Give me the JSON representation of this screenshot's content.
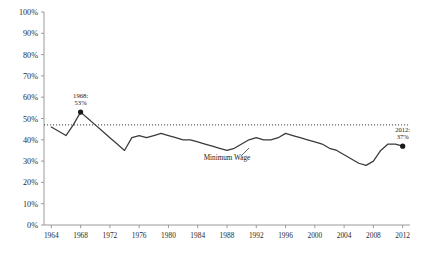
{
  "chart_data": {
    "type": "line",
    "title": "",
    "subtitle": "",
    "xlabel": "",
    "ylabel": "",
    "xlim": [
      1963,
      2013
    ],
    "ylim": [
      0,
      100
    ],
    "grid": false,
    "legend_position": "inline",
    "y_tick_labels": [
      "100%",
      "90%",
      "80%",
      "70%",
      "60%",
      "50%",
      "40%",
      "30%",
      "20%",
      "10%",
      "0%"
    ],
    "y_tick_values": [
      100,
      90,
      80,
      70,
      60,
      50,
      40,
      30,
      20,
      10,
      0
    ],
    "x_tick_labels": [
      "1964",
      "1968",
      "1972",
      "1976",
      "1980",
      "1984",
      "1988",
      "1992",
      "1996",
      "2000",
      "2004",
      "2008",
      "2012"
    ],
    "x_tick_values": [
      1964,
      1968,
      1972,
      1976,
      1980,
      1984,
      1988,
      1992,
      1996,
      2000,
      2004,
      2008,
      2012
    ],
    "series": [
      {
        "name": "Minimum Wage",
        "inline_label": "Minimum Wage",
        "color": "#3a3a3a",
        "x": [
          1964,
          1965,
          1966,
          1967,
          1968,
          1969,
          1970,
          1971,
          1972,
          1973,
          1974,
          1975,
          1976,
          1977,
          1978,
          1979,
          1980,
          1981,
          1982,
          1983,
          1984,
          1985,
          1986,
          1987,
          1988,
          1989,
          1990,
          1991,
          1992,
          1993,
          1994,
          1995,
          1996,
          1997,
          1998,
          1999,
          2000,
          2001,
          2002,
          2003,
          2004,
          2005,
          2006,
          2007,
          2008,
          2009,
          2010,
          2011,
          2012
        ],
        "values": [
          46,
          44,
          42,
          47,
          53,
          50,
          47,
          44,
          41,
          38,
          35,
          41,
          42,
          41,
          42,
          43,
          42,
          41,
          40,
          40,
          39,
          38,
          37,
          36,
          35,
          36,
          38,
          40,
          41,
          40,
          40,
          41,
          43,
          42,
          41,
          40,
          39,
          38,
          36,
          35,
          33,
          31,
          29,
          28,
          30,
          35,
          38,
          38,
          37
        ]
      }
    ],
    "reference_lines": [
      {
        "name": "1964 baseline",
        "orientation": "horizontal",
        "value": 47,
        "style": "dotted",
        "color": "#3a3a3a"
      }
    ],
    "annotations": [
      {
        "name": "peak-1968",
        "x": 1968,
        "y": 53,
        "line1": "1968:",
        "line2": "53%",
        "marker": true
      },
      {
        "name": "end-2012",
        "x": 2012,
        "y": 37,
        "line1": "2012:",
        "line2": "37%",
        "marker": true
      }
    ]
  },
  "colors": {
    "line": "#3a3a3a",
    "axis": "#9a9a9a",
    "text": "#1a1a1a",
    "background": "#ffffff"
  }
}
